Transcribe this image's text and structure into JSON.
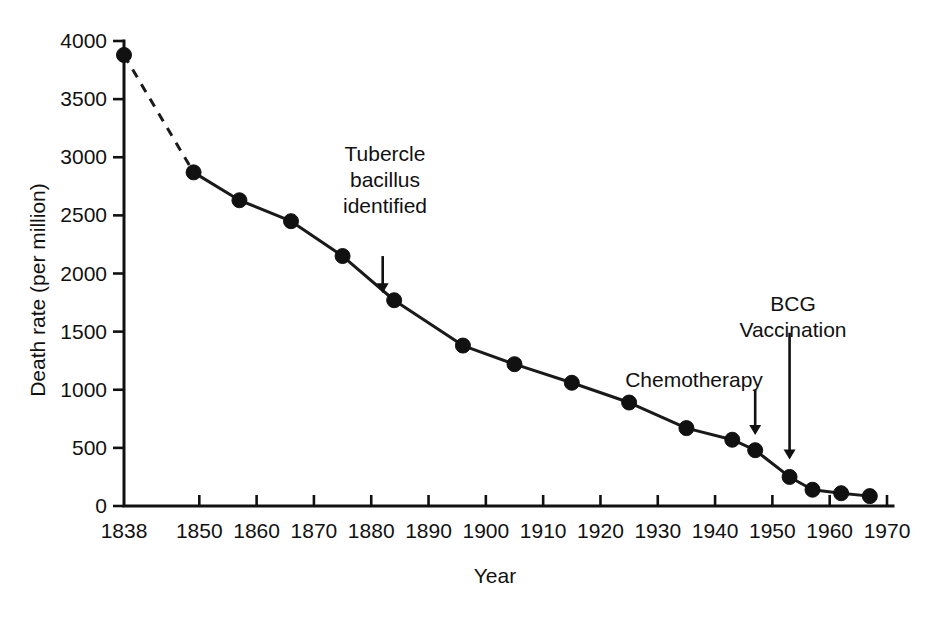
{
  "chart_data": {
    "type": "line",
    "title": "",
    "xlabel": "Year",
    "ylabel": "Death rate (per million)",
    "xlim": [
      1838,
      1970
    ],
    "ylim": [
      0,
      4000
    ],
    "grid": false,
    "legend": "none",
    "x_tick_labels": [
      "1838",
      "1850",
      "1860",
      "1870",
      "1880",
      "1890",
      "1900",
      "1910",
      "1920",
      "1930",
      "1940",
      "1950",
      "1960",
      "1970"
    ],
    "x_ticks": [
      1838,
      1850,
      1860,
      1870,
      1880,
      1890,
      1900,
      1910,
      1920,
      1930,
      1940,
      1950,
      1960,
      1970
    ],
    "y_tick_labels": [
      "0",
      "500",
      "1000",
      "1500",
      "2000",
      "2500",
      "3000",
      "3500",
      "4000"
    ],
    "y_ticks": [
      0,
      500,
      1000,
      1500,
      2000,
      2500,
      3000,
      3500,
      4000
    ],
    "series": [
      {
        "name": "Tuberculosis death rate",
        "x": [
          1838,
          1849,
          1857,
          1866,
          1875,
          1884,
          1896,
          1905,
          1915,
          1925,
          1935,
          1943,
          1947,
          1953,
          1957,
          1962,
          1967
        ],
        "values": [
          3880,
          2870,
          2630,
          2450,
          2150,
          1770,
          1380,
          1220,
          1060,
          890,
          670,
          570,
          480,
          250,
          140,
          110,
          85
        ],
        "dashed_segment": {
          "from_index": 0,
          "to_index": 1,
          "note": "dashed"
        }
      }
    ],
    "annotations": [
      {
        "id": "tubercle",
        "label_lines": [
          "Tubercle",
          "bacillus",
          "identified"
        ],
        "arrow_year": 1882,
        "arrow_from_rate": 2150,
        "arrow_to_rate": 1830
      },
      {
        "id": "chemotherapy",
        "label_lines": [
          "Chemotherapy"
        ],
        "arrow_year": 1947,
        "arrow_from_rate": 1000,
        "arrow_to_rate": 610
      },
      {
        "id": "bcg",
        "label_lines": [
          "BCG",
          "Vaccination"
        ],
        "arrow_year": 1953,
        "arrow_from_rate": 1490,
        "arrow_to_rate": 400
      }
    ],
    "colors": {
      "line": "#1a1a1a",
      "marker": "#111111",
      "axis": "#111111",
      "background": "#ffffff"
    }
  }
}
